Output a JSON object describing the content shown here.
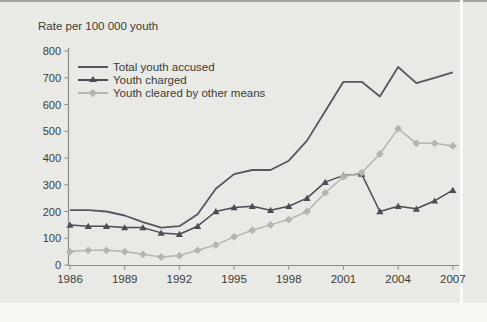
{
  "figure": {
    "y_axis_title": "Rate per 100 000 youth"
  },
  "chart_data": {
    "type": "line",
    "title": "",
    "ylabel": "Rate per 100 000 youth",
    "xlabel": "",
    "ylim": [
      0,
      800
    ],
    "y_tick_step": 100,
    "y_tick_labels": [
      "0",
      "100",
      "200",
      "300",
      "400",
      "500",
      "600",
      "700",
      "800"
    ],
    "x_tick_labels": [
      "1986",
      "1989",
      "1992",
      "1995",
      "1998",
      "2001",
      "2004",
      "2007"
    ],
    "grid": false,
    "legend_position": "top-left-inside",
    "background_color": "#e9eae5",
    "axis_color": "#8b8d88",
    "text_color": "#3b3c36",
    "x": [
      1986,
      1987,
      1988,
      1989,
      1990,
      1991,
      1992,
      1993,
      1994,
      1995,
      1996,
      1997,
      1998,
      1999,
      2000,
      2001,
      2002,
      2003,
      2004,
      2005,
      2006,
      2007
    ],
    "series": [
      {
        "name": "Total youth accused",
        "marker": "none",
        "color": "#565760",
        "values": [
          205,
          205,
          200,
          185,
          160,
          140,
          145,
          190,
          285,
          340,
          355,
          355,
          390,
          465,
          575,
          685,
          685,
          630,
          740,
          680,
          700,
          720
        ]
      },
      {
        "name": "Youth charged",
        "marker": "triangle",
        "color": "#4b4c54",
        "values": [
          150,
          145,
          145,
          140,
          140,
          120,
          115,
          145,
          200,
          215,
          220,
          205,
          220,
          250,
          310,
          335,
          340,
          200,
          220,
          210,
          240,
          280
        ]
      },
      {
        "name": "Youth cleared by other means",
        "marker": "diamond",
        "color": "#b3b5b0",
        "values": [
          50,
          55,
          55,
          50,
          40,
          30,
          35,
          55,
          75,
          105,
          130,
          150,
          170,
          200,
          270,
          330,
          345,
          415,
          510,
          455,
          455,
          445
        ]
      }
    ]
  }
}
